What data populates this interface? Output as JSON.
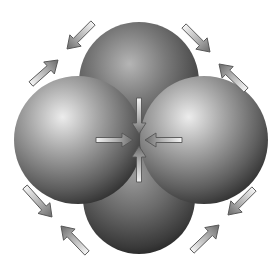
{
  "figure": {
    "width": 278,
    "height": 278,
    "background": "#ffffff"
  },
  "spheres": [
    {
      "id": "top",
      "cx": 139,
      "cy": 82,
      "r": 60
    },
    {
      "id": "bottom",
      "cx": 139,
      "cy": 198,
      "r": 56
    },
    {
      "id": "left",
      "cx": 78,
      "cy": 140,
      "r": 64
    },
    {
      "id": "right",
      "cx": 204,
      "cy": 140,
      "r": 64
    }
  ],
  "center_arrows": [
    {
      "id": "from-top",
      "x1": 139,
      "y1": 98,
      "x2": 139,
      "y2": 134
    },
    {
      "id": "from-bottom",
      "x1": 139,
      "y1": 182,
      "x2": 139,
      "y2": 146
    },
    {
      "id": "from-left",
      "x1": 96,
      "y1": 140,
      "x2": 133,
      "y2": 140
    },
    {
      "id": "from-right",
      "x1": 182,
      "y1": 140,
      "x2": 145,
      "y2": 140
    }
  ],
  "corner_arrows": [
    {
      "id": "tl-inward",
      "x1": 93,
      "y1": 23,
      "x2": 67,
      "y2": 49
    },
    {
      "id": "tl-outward",
      "x1": 31,
      "y1": 84,
      "x2": 58,
      "y2": 60
    },
    {
      "id": "tr-inward",
      "x1": 184,
      "y1": 26,
      "x2": 210,
      "y2": 52
    },
    {
      "id": "tr-outward",
      "x1": 246,
      "y1": 90,
      "x2": 219,
      "y2": 64
    },
    {
      "id": "bl-inward",
      "x1": 25,
      "y1": 187,
      "x2": 52,
      "y2": 217
    },
    {
      "id": "bl-outward",
      "x1": 87,
      "y1": 253,
      "x2": 61,
      "y2": 226
    },
    {
      "id": "br-inward",
      "x1": 254,
      "y1": 189,
      "x2": 228,
      "y2": 215
    },
    {
      "id": "br-outward",
      "x1": 192,
      "y1": 251,
      "x2": 219,
      "y2": 225
    }
  ],
  "colors": {
    "sphere_highlight": "#e6e6e6",
    "sphere_mid": "#8a8a8a",
    "sphere_shadow": "#2e2e2e",
    "arrow_fill_light": "#f2f2f2",
    "arrow_fill_dark": "#6a6a6a",
    "arrow_stroke": "#555555"
  }
}
